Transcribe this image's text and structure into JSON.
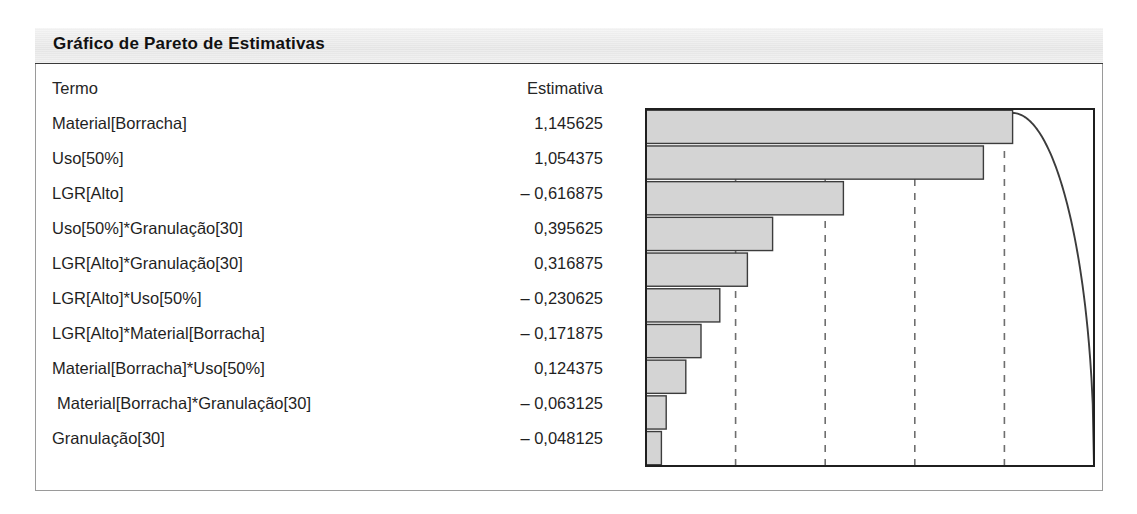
{
  "panel": {
    "title": "Gráfico de Pareto de Estimativas"
  },
  "table": {
    "headers": {
      "term": "Termo",
      "estimate": "Estimativa"
    },
    "rows": [
      {
        "term": "Material[Borracha]",
        "estimate": "1,145625",
        "indented": false
      },
      {
        "term": "Uso[50%]",
        "estimate": "1,054375",
        "indented": false
      },
      {
        "term": "LGR[Alto]",
        "estimate": "– 0,616875",
        "indented": false
      },
      {
        "term": "Uso[50%]*Granulação[30]",
        "estimate": "0,395625",
        "indented": false
      },
      {
        "term": "LGR[Alto]*Granulação[30]",
        "estimate": "0,316875",
        "indented": false
      },
      {
        "term": "LGR[Alto]*Uso[50%]",
        "estimate": "– 0,230625",
        "indented": false
      },
      {
        "term": "LGR[Alto]*Material[Borracha]",
        "estimate": "– 0,171875",
        "indented": false
      },
      {
        "term": "Material[Borracha]*Uso[50%]",
        "estimate": "0,124375",
        "indented": false
      },
      {
        "term": "Material[Borracha]*Granulação[30]",
        "estimate": "– 0,063125",
        "indented": true
      },
      {
        "term": "Granulação[30]",
        "estimate": "– 0,048125",
        "indented": false
      }
    ]
  },
  "chart_data": {
    "type": "bar",
    "title": "Gráfico de Pareto de Estimativas",
    "xlabel": "",
    "ylabel": "",
    "orientation": "horizontal",
    "grid": "vertical-dashed",
    "legend": "none",
    "categories": [
      "Material[Borracha]",
      "Uso[50%]",
      "LGR[Alto]",
      "Uso[50%]*Granulação[30]",
      "LGR[Alto]*Granulação[30]",
      "LGR[Alto]*Uso[50%]",
      "LGR[Alto]*Material[Borracha]",
      "Material[Borracha]*Uso[50%]",
      "Material[Borracha]*Granulação[30]",
      "Granulação[30]"
    ],
    "estimates": [
      1.145625,
      1.054375,
      -0.616875,
      0.395625,
      0.316875,
      -0.230625,
      -0.171875,
      0.124375,
      -0.063125,
      -0.048125
    ],
    "values": [
      1.145625,
      1.054375,
      0.616875,
      0.395625,
      0.316875,
      0.230625,
      0.171875,
      0.124375,
      0.063125,
      0.048125
    ],
    "xlim": [
      0,
      1.4
    ],
    "gridlines": [
      0.28,
      0.56,
      0.84,
      1.12
    ],
    "cumulative_percent": [
      27.4,
      52.6,
      67.3,
      76.8,
      84.4,
      89.9,
      94.0,
      97.0,
      98.5,
      100.0
    ],
    "colors": {
      "bar_fill": "#d4d4d4",
      "bar_border": "#3c3c3c",
      "curve": "#3c3c3c",
      "gridline": "#6e6e6e",
      "axis": "#1f1f1f",
      "panel_border": "#9a9a9a",
      "title_band": "#e9e9e9"
    }
  }
}
